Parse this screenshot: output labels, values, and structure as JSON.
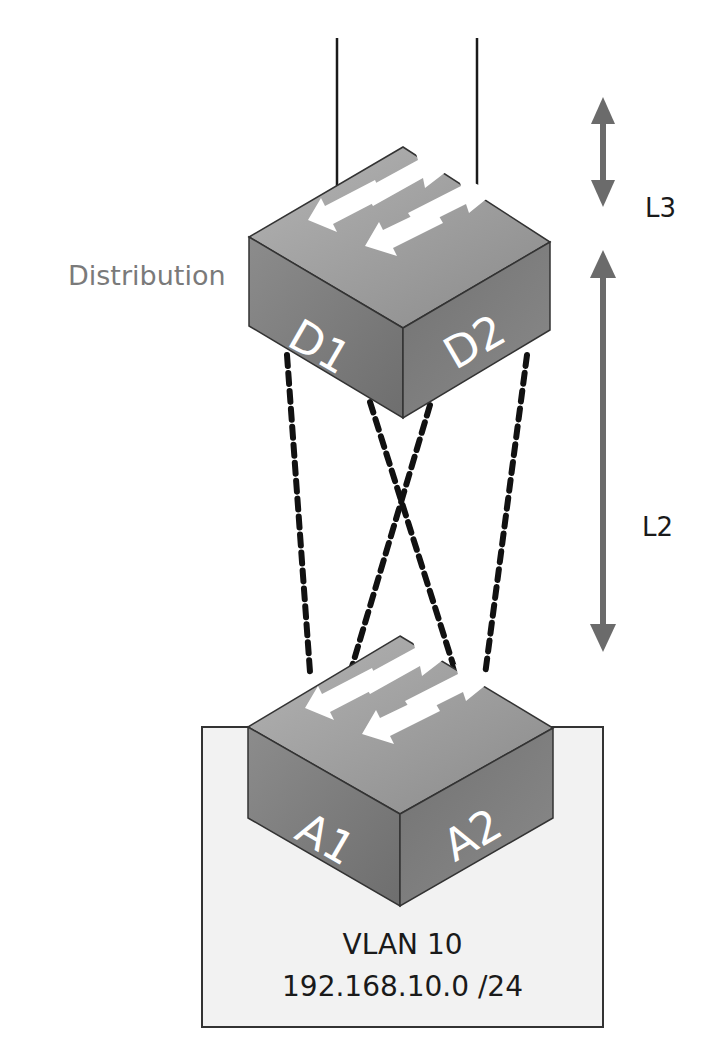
{
  "diagram": {
    "tier_label": "Distribution",
    "layers": [
      {
        "label": "L3",
        "arrow_icon": "double-arrow-vertical"
      },
      {
        "label": "L2",
        "arrow_icon": "double-arrow-vertical"
      }
    ],
    "switches": {
      "distribution": {
        "left_label": "D1",
        "right_label": "D2"
      },
      "access": {
        "left_label": "A1",
        "right_label": "A2"
      }
    },
    "vlan": {
      "name": "VLAN 10",
      "subnet": "192.168.10.0 /24"
    },
    "links": [
      {
        "from": "D1",
        "to": "A1",
        "style": "dashed"
      },
      {
        "from": "D1",
        "to": "A2",
        "style": "dashed"
      },
      {
        "from": "D2",
        "to": "A1",
        "style": "dashed"
      },
      {
        "from": "D2",
        "to": "A2",
        "style": "dashed"
      }
    ],
    "colors": {
      "arrow": "#6b6b6b",
      "switch_top": "#9a9a9a",
      "switch_left": "#7e7e7e",
      "switch_right": "#6a6a6a",
      "vlan_box_fill": "#f2f2f2",
      "label_gray": "#7a7a7a"
    }
  }
}
